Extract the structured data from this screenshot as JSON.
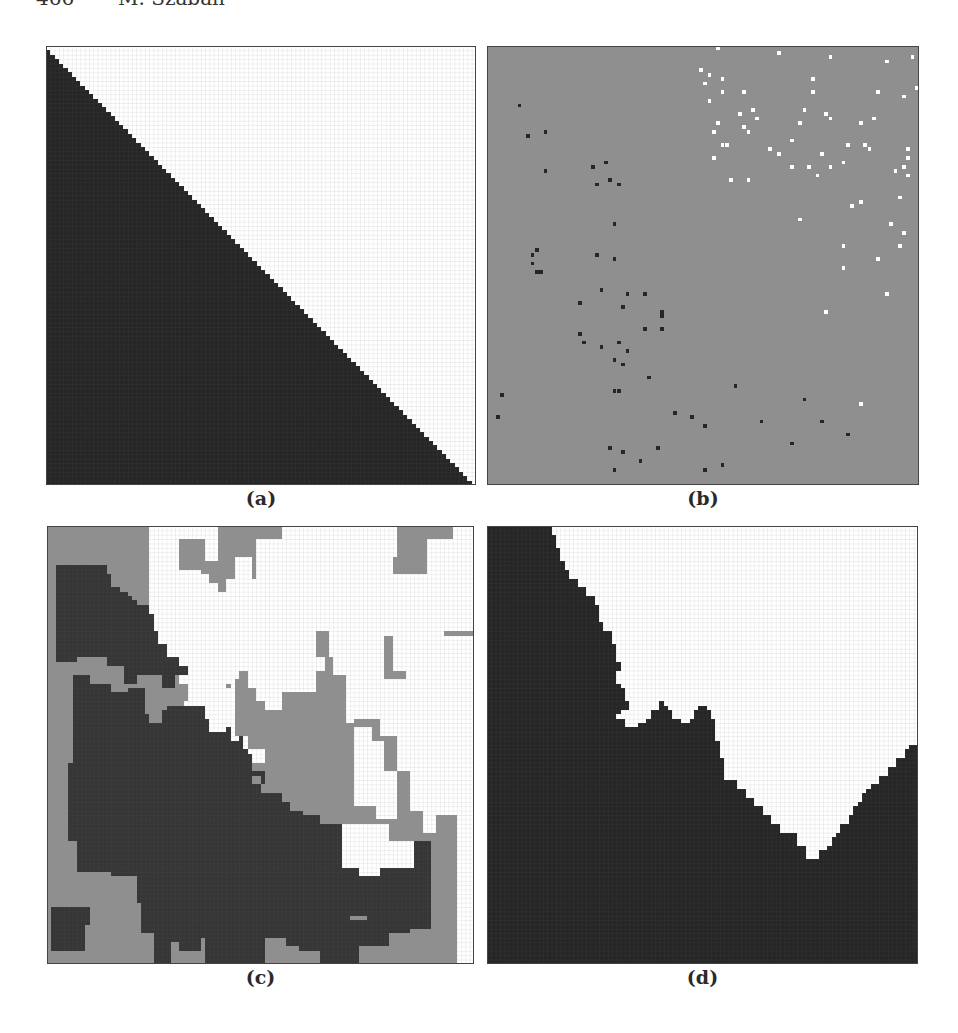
{
  "header": {
    "page_number": "466",
    "author": "M. Szaban"
  },
  "colors": {
    "black": "#262626",
    "dark": "#363636",
    "gray": "#8f8f8f",
    "white": "#ffffff",
    "grid_on_white": "#9a9a9a",
    "grid_on_dark": "#555555"
  },
  "figure": {
    "grid_size": 100,
    "panels": [
      {
        "id": "a",
        "caption": "(a)",
        "box": {
          "left": 46,
          "top": 46,
          "width": 430,
          "height": 439
        },
        "background": "white",
        "grid": true,
        "regions": [
          {
            "fill": "black",
            "points": "0,1 1,1 1,2 2,2 2,3 3,3 3,4 4,4 4,5 5,5 5,6 6,6 6,7 7,7 7,8 8,8 8,9 9,9 9,10 10,10 10,11 11,11 11,12 12,12 12,13 13,13 13,14 14,14 14,15 15,15 15,16 16,16 16,17 17,17 17,18 18,18 18,19 19,19 19,20 20,20 20,21 21,21 21,22 22,22 22,23 23,23 23,24 24,24 24,25 25,25 25,26 26,26 26,27 27,27 27,28 28,28 28,29 29,29 29,30 30,30 30,31 31,31 31,32 32,32 32,33 33,33 33,34 34,34 34,35 35,35 35,36 36,36 36,37 37,37 37,38 38,38 38,39 39,39 39,40 40,40 40,41 41,41 41,42 42,42 42,43 43,43 43,44 44,44 44,45 45,45 45,46 46,46 46,47 47,47 47,48 48,48 48,49 49,49 49,50 50,50 50,51 51,51 51,52 52,52 52,53 53,53 53,54 54,54 54,55 55,55 55,56 56,56 56,57 57,57 57,58 58,58 58,59 59,59 59,60 60,60 60,61 61,61 61,62 62,62 62,63 63,63 63,64 64,64 64,65 65,65 65,66 66,66 66,67 67,67 67,68 68,68 68,69 69,69 69,70 70,70 70,71 71,71 71,72 72,72 72,73 73,73 73,74 74,74 74,75 75,75 75,76 76,76 76,77 77,77 77,78 78,78 78,79 79,79 79,80 80,80 80,81 81,81 81,82 82,82 82,83 83,83 83,84 84,84 84,85 85,85 85,86 86,86 86,87 87,87 87,88 88,88 88,89 89,89 89,90 90,90 90,91 91,91 91,92 92,92 92,93 93,93 93,94 94,94 94,95 95,95 95,96 96,96 96,97 97,97 97,98 98,98 98,99 99,99 99,100 0,100"
          }
        ],
        "dots": []
      },
      {
        "id": "b",
        "caption": "(b)",
        "box": {
          "left": 487,
          "top": 46,
          "width": 432,
          "height": 439
        },
        "background": "gray",
        "grid": false,
        "regions": [],
        "dots": [
          {
            "fill": "white",
            "cells": [
              [
                53,
                0
              ],
              [
                59,
                10
              ],
              [
                67,
                1
              ],
              [
                79,
                2
              ],
              [
                90,
                10
              ],
              [
                92,
                3
              ],
              [
                98,
                2
              ],
              [
                99,
                9
              ],
              [
                97,
                23
              ],
              [
                97,
                25
              ],
              [
                96,
                11
              ],
              [
                86,
                17
              ],
              [
                72,
                17
              ],
              [
                67,
                24
              ],
              [
                55,
                22
              ],
              [
                59,
                18
              ],
              [
                61,
                14
              ],
              [
                62,
                16
              ],
              [
                51,
                12
              ],
              [
                50,
                8
              ],
              [
                51,
                6
              ],
              [
                54,
                10
              ],
              [
                49,
                5
              ],
              [
                75,
                10
              ],
              [
                73,
                14
              ],
              [
                87,
                22
              ],
              [
                83,
                22
              ],
              [
                96,
                27
              ],
              [
                97,
                29
              ],
              [
                94,
                28
              ],
              [
                88,
                23
              ],
              [
                89,
                16
              ],
              [
                82,
                26
              ],
              [
                70,
                27
              ],
              [
                76,
                29
              ],
              [
                74,
                27
              ],
              [
                79,
                27
              ],
              [
                77,
                24
              ],
              [
                65,
                23
              ],
              [
                70,
                21
              ],
              [
                53,
                17
              ],
              [
                52,
                19
              ],
              [
                54,
                22
              ],
              [
                52,
                25
              ],
              [
                58,
                15
              ],
              [
                60,
                19
              ],
              [
                75,
                7
              ],
              [
                79,
                16
              ],
              [
                78,
                15
              ],
              [
                84,
                36
              ],
              [
                86,
                35
              ],
              [
                93,
                40
              ],
              [
                95,
                34
              ],
              [
                92,
                56
              ],
              [
                95,
                45
              ],
              [
                96,
                42
              ],
              [
                90,
                48
              ],
              [
                82,
                45
              ],
              [
                82,
                50
              ],
              [
                72,
                39
              ],
              [
                78,
                60
              ],
              [
                86,
                81
              ],
              [
                56,
                30
              ],
              [
                60,
                30
              ],
              [
                54,
                7
              ]
            ]
          },
          {
            "fill": "black",
            "cells": [
              [
                7,
                13
              ],
              [
                9,
                20
              ],
              [
                13,
                19
              ],
              [
                13,
                28
              ],
              [
                24,
                27
              ],
              [
                25,
                31
              ],
              [
                27,
                26
              ],
              [
                28,
                30
              ],
              [
                30,
                31
              ],
              [
                29,
                40
              ],
              [
                11,
                46
              ],
              [
                10,
                47
              ],
              [
                11,
                51
              ],
              [
                10,
                49
              ],
              [
                12,
                51
              ],
              [
                25,
                47
              ],
              [
                29,
                48
              ],
              [
                26,
                55
              ],
              [
                21,
                65
              ],
              [
                26,
                68
              ],
              [
                22,
                67
              ],
              [
                21,
                58
              ],
              [
                31,
                59
              ],
              [
                32,
                56
              ],
              [
                36,
                56
              ],
              [
                40,
                61
              ],
              [
                36,
                64
              ],
              [
                30,
                67
              ],
              [
                29,
                71
              ],
              [
                31,
                72
              ],
              [
                32,
                69
              ],
              [
                29,
                78
              ],
              [
                30,
                78
              ],
              [
                37,
                75
              ],
              [
                40,
                64
              ],
              [
                40,
                60
              ],
              [
                43,
                83
              ],
              [
                47,
                84
              ],
              [
                50,
                86
              ],
              [
                57,
                77
              ],
              [
                63,
                85
              ],
              [
                73,
                80
              ],
              [
                70,
                90
              ],
              [
                77,
                85
              ],
              [
                39,
                91
              ],
              [
                3,
                79
              ],
              [
                2,
                84
              ],
              [
                28,
                91
              ],
              [
                31,
                92
              ],
              [
                35,
                94
              ],
              [
                29,
                96
              ],
              [
                50,
                96
              ],
              [
                54,
                95
              ],
              [
                83,
                88
              ]
            ]
          }
        ]
      },
      {
        "id": "c",
        "caption": "(c)",
        "box": {
          "left": 47,
          "top": 526,
          "width": 427,
          "height": 438
        },
        "background": "gray",
        "grid": true,
        "regions": [
          {
            "fill": "white",
            "points": "24,0 40,0 40,8 37,8 37,3 31,3 31,10 36,10 36,11 38,11 38,13 40,13 40,15 42,15 42,12 44,12 44,7 48,7 48,12 49,12 49,3 55,3 55,0 82,0 82,7 81,7 81,11 89,11 89,3 95,3 95,0 100,0 100,100 96,100 96,66 91,66 91,70 88,70 88,65 85,65 85,56 82,56 82,48 78,48 78,44 72,44 72,45 70,45 70,34 67,34 67,30 65,30 65,33 63,33 63,38 55,38 55,42 51,42 51,40 49,40 49,37 47,37 47,33 45,33 45,35 44,35 44,48 47,48 47,51 51,51 51,54 48,54 48,56 46,56 46,52 37,52 37,49 34,49 34,46 32,46 32,40 33,40 33,36 31,36 31,30 28,30 28,27 26,27 26,24 25,24 25,20 24,20 24,0"
          },
          {
            "fill": "white",
            "points": "72,46 76,46 76,49 79,49 79,56 82,56 82,67 77,67 77,64 72,64 72,46"
          },
          {
            "fill": "white",
            "points": "69,68 80,68 80,72 86,72 86,78 78,78 78,80 73,80 73,78 69,78 69,68"
          },
          {
            "fill": "dark",
            "points": "2,11 14,11 14,20 18,20 18,23 20,23 20,25 21,25 21,27 22,27 22,31 23,31 23,34 27,34 27,37 30,37 30,34 33,34 33,32 31,32 31,30 28,30 28,27 26,27 26,24 25,24 25,20 24,20 24,18 21,18 21,17 20,17 20,16 19,16 19,15 17,15 17,14 15,14 15,11 14,11 14,9 2,9 2,11 Z"
          },
          {
            "fill": "dark",
            "points": "2,9 14,9 14,20 18,20 18,22 20,22 20,24 22,24 22,28 23,28 23,32 24,32 24,34 21,34 21,36 18,36 18,32 14,32 14,30 7,30 7,31 2,31 2,9"
          },
          {
            "fill": "dark",
            "points": "5,34 10,34 10,36 15,36 15,38 19,38 19,37 23,37 23,43 24,43 24,45 27,45 27,42 28,42 28,41 37,41 37,44 38,44 38,47 42,47 42,46 43,46 43,49 45,49 45,48 46,48 46,51 47,51 47,52 48,52 48,56 51,56 51,59 50,59 50,61 55,61 55,63 57,63 57,65 60,65 60,66 64,66 64,68 69,68 69,78 73,78 73,80 78,80 78,78 86,78 86,72 90,72 90,92 85,92 85,93 80,93 80,96 73,96 73,100 64,100 64,97 59,97 59,96 56,96 56,94 51,94 51,95 51,100 37,100 37,94 36,94 36,97 31,97 31,95 29,95 29,100 25,100 25,93 22,93 22,86 21,86 21,80 15,80 15,79 7,79 7,72 5,72 5,54 6,54 6,34 5,34"
          },
          {
            "fill": "dark",
            "points": "1,87 10,87 10,91 9,91 9,97 1,97 1,87"
          },
          {
            "fill": "gray",
            "points": "51,43 53,43 53,44 51,44"
          },
          {
            "fill": "gray",
            "points": "71,89 75,89 75,90 71,90"
          },
          {
            "fill": "gray",
            "points": "48,57 50,57 50,59 48,59"
          },
          {
            "fill": "gray",
            "points": "42,36 43,36 43,37 42,37"
          },
          {
            "fill": "gray",
            "points": "93,24 100,24 100,25 93,25"
          },
          {
            "fill": "gray",
            "points": "63,24 66,24 66,30 63,30"
          },
          {
            "fill": "gray",
            "points": "79,25 81,25 81,33 84,33 84,35 79,35 79,25"
          }
        ],
        "dots": []
      },
      {
        "id": "d",
        "caption": "(d)",
        "box": {
          "left": 487,
          "top": 526,
          "width": 431,
          "height": 438
        },
        "background": "white",
        "grid": true,
        "regions": [
          {
            "fill": "black",
            "points": "0,0 15,0 15,2 16,2 16,5 17,5 17,8 18,8 18,10 19,10 19,12 21,12 21,14 23,14 23,16 25,16 25,18 26,18 26,22 27,22 27,24 29,24 29,27 30,27 30,31 31,31 31,33 30,33 30,36 31,36 31,37 32,37 32,40 33,40 33,42 31,42 31,43 30,43 30,44 32,44 32,46 35,46 35,45 37,45 37,44 38,44 38,42 40,42 40,40 41,40 41,41 42,41 42,42 43,42 43,44 45,44 45,45 47,45 47,44 48,44 48,42 49,42 49,41 51,41 51,42 52,42 52,44 53,44 53,49 54,49 54,53 55,53 55,58 58,58 58,60 60,60 60,62 62,62 62,64 64,64 64,66 66,66 66,68 68,68 68,70 72,70 72,73 74,73 74,76 77,76 77,74 79,74 79,73 80,73 80,71 81,71 81,70 82,70 82,68 84,68 84,66 85,66 85,64 86,64 86,63 87,63 87,61 88,61 88,60 89,60 89,59 91,59 91,57 93,57 93,55 95,55 95,53 97,53 97,51 98,51 98,50 100,50 100,100 0,100 0,0"
          }
        ],
        "dots": []
      }
    ]
  }
}
